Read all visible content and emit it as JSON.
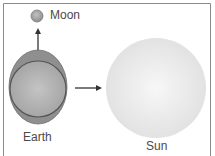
{
  "diagram": {
    "labels": {
      "moon": "Moon",
      "earth": "Earth",
      "sun": "Sun"
    },
    "colors": {
      "frame": "#8a8a8a",
      "earth_outer": "#8d8d8d",
      "earth_inner": "#b5b5b5",
      "moon": "#a8a8a8",
      "sun": "#ececec",
      "arrow": "#333333",
      "text": "#4a4a4a"
    }
  }
}
